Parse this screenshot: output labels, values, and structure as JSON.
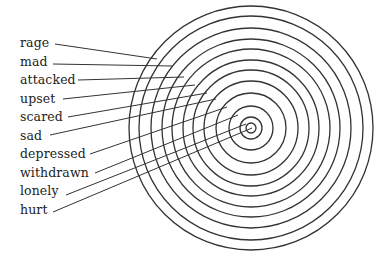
{
  "diagram": {
    "type": "concentric-target",
    "center": [
      251,
      128
    ],
    "ring_radii": [
      122,
      112,
      100,
      89,
      79,
      68,
      58,
      47,
      35,
      22,
      11,
      5
    ],
    "ring_color": "#333333",
    "line_color": "#333333",
    "labels": [
      {
        "text": "rage",
        "top": 36,
        "line": [
          55,
          44,
          157,
          59
        ]
      },
      {
        "text": "mad",
        "top": 55,
        "line": [
          53,
          64,
          172,
          66
        ]
      },
      {
        "text": "attacked",
        "top": 73,
        "line": [
          78,
          80,
          184,
          77
        ]
      },
      {
        "text": "upset",
        "top": 92,
        "line": [
          63,
          99,
          195,
          85
        ]
      },
      {
        "text": "scared",
        "top": 110,
        "line": [
          68,
          117,
          207,
          93
        ]
      },
      {
        "text": "sad",
        "top": 129,
        "line": [
          50,
          135,
          216,
          99
        ]
      },
      {
        "text": "depressed",
        "top": 147,
        "line": [
          90,
          154,
          227,
          107
        ]
      },
      {
        "text": "withdrawn",
        "top": 166,
        "line": [
          95,
          173,
          238,
          115
        ]
      },
      {
        "text": "lonely",
        "top": 184,
        "line": [
          66,
          195,
          246,
          124
        ]
      },
      {
        "text": "hurt",
        "top": 203,
        "line": [
          53,
          212,
          252,
          128
        ]
      }
    ]
  }
}
